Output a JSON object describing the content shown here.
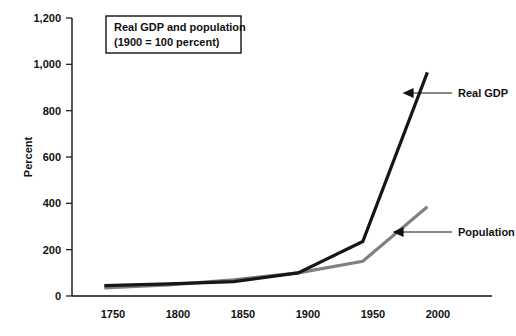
{
  "chart_data": {
    "type": "line",
    "title": "Real GDP and population",
    "subtitle": "(1900 = 100 percent)",
    "xlabel": "",
    "ylabel": "Percent",
    "x": [
      1750,
      1800,
      1850,
      1900,
      1950,
      2000
    ],
    "xticklabels": [
      "1750",
      "1800",
      "1850",
      "1900",
      "1950",
      "2000"
    ],
    "xlim": [
      1725,
      2050
    ],
    "ylim": [
      0,
      1200
    ],
    "yticks": [
      0,
      200,
      400,
      600,
      800,
      1000,
      1200
    ],
    "yticklabels": [
      "0",
      "200",
      "400",
      "600",
      "800",
      "1,000",
      "1,200"
    ],
    "grid": false,
    "legend": "annotations-right",
    "series": [
      {
        "name": "Real GDP",
        "color": "#161616",
        "values": [
          45,
          52,
          62,
          100,
          235,
          965
        ]
      },
      {
        "name": "Population",
        "color": "#808080",
        "values": [
          35,
          48,
          70,
          100,
          150,
          385
        ]
      }
    ],
    "annotations": [
      {
        "label": "Real GDP",
        "series": "Real GDP"
      },
      {
        "label": "Population",
        "series": "Population"
      }
    ]
  }
}
